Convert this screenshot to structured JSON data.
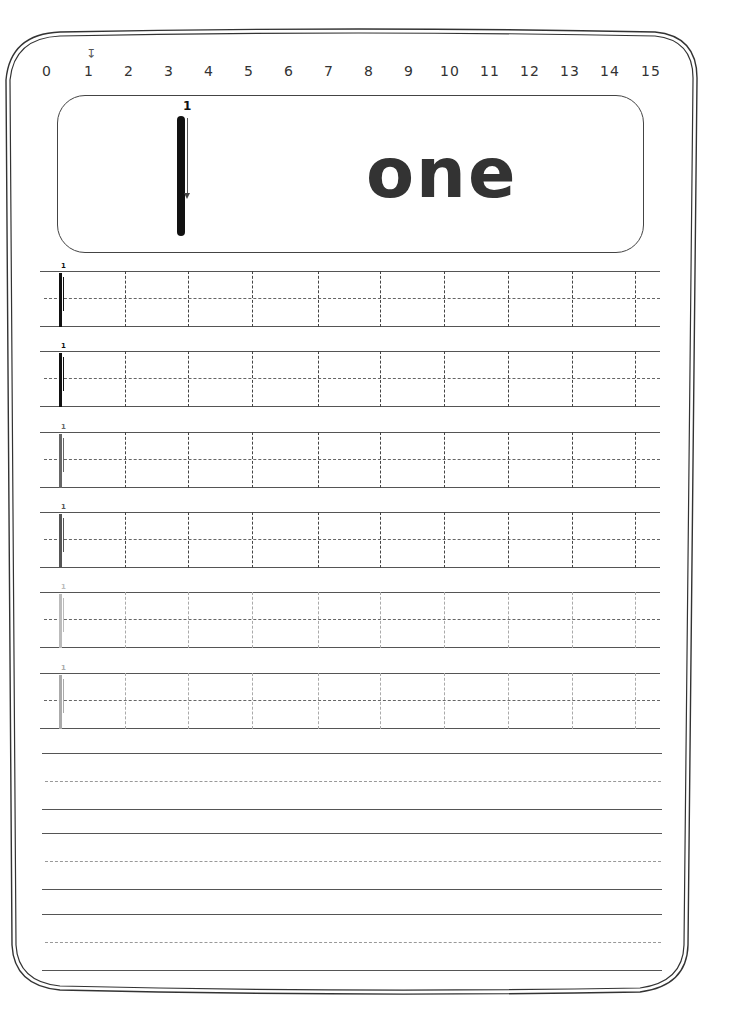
{
  "worksheet": {
    "number_line": {
      "ticks": [
        "0",
        "1",
        "2",
        "3",
        "4",
        "5",
        "6",
        "7",
        "8",
        "9",
        "10",
        "11",
        "12",
        "13",
        "14",
        "15"
      ],
      "positions": [
        47,
        89,
        129,
        169,
        209,
        249,
        289,
        329,
        369,
        409,
        450,
        490,
        530,
        570,
        610,
        651
      ],
      "highlighted": "1",
      "marker_icon": "down-arrow-icon"
    },
    "model": {
      "digit": "1",
      "stroke_order": "1",
      "word": "one"
    },
    "practice_rows": [
      {
        "stroke_number": "1",
        "shade": "#111111",
        "line_color": "#444444"
      },
      {
        "stroke_number": "1",
        "shade": "#111111",
        "line_color": "#444444"
      },
      {
        "stroke_number": "1",
        "shade": "#666666",
        "line_color": "#444444"
      },
      {
        "stroke_number": "1",
        "shade": "#555555",
        "line_color": "#444444"
      },
      {
        "stroke_number": "1",
        "shade": "#bbbbbb",
        "line_color": "#aaaaaa"
      },
      {
        "stroke_number": "1",
        "shade": "#aaaaaa",
        "line_color": "#aaaaaa"
      }
    ],
    "row_tops": [
      271,
      351,
      432,
      512,
      592,
      673
    ],
    "column_dividers": [
      85,
      148,
      212,
      278,
      340,
      404,
      468,
      532,
      595
    ],
    "lined_writing": {
      "solid_lines": [
        753,
        809,
        833,
        889,
        914,
        970
      ],
      "dashed_lines": [
        781,
        861,
        942
      ]
    },
    "colors": {
      "ink": "#111111",
      "border": "#333333",
      "guide": "#666666"
    }
  }
}
